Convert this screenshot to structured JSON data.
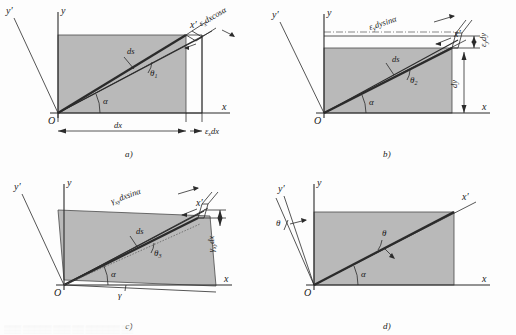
{
  "figure": {
    "background_color": "#fdfdfd",
    "box_fill_color": "#b9b9b9",
    "line_color": "#2b2b2b",
    "bleed_text": "▒▒▒ ▒▒▒▒▒ ▒▒▒ ▒▒ ▒▒▒▒▒▒ ▒▒"
  },
  "axis_labels": {
    "x": "x",
    "y": "y",
    "x_prime": "x′",
    "y_prime": "y′",
    "origin": "O"
  },
  "panels": [
    {
      "id": "a",
      "caption": "a)",
      "elements": {
        "diagonal_label": "ds",
        "rotation_angle": "θ",
        "rotation_angle_sub": "1",
        "base_angle": "α",
        "horizontal_dim": "dx",
        "elongation_dim": "ε",
        "elongation_dim_sub": "x",
        "elongation_dim_tail": "dx",
        "projection_label": "ε",
        "projection_label_sub": "x",
        "projection_label_tail": "dxcosα"
      }
    },
    {
      "id": "b",
      "caption": "b)",
      "elements": {
        "diagonal_label": "ds",
        "rotation_angle": "θ",
        "rotation_angle_sub": "2",
        "base_angle": "α",
        "vertical_dim": "dy",
        "elongation_dim": "ε",
        "elongation_dim_sub": "y",
        "elongation_dim_tail": "dy",
        "projection_label": "ε",
        "projection_label_sub": "y",
        "projection_label_tail": "dysinα"
      }
    },
    {
      "id": "c",
      "caption": "c)",
      "elements": {
        "diagonal_label": "ds",
        "rotation_angle": "θ",
        "rotation_angle_sub": "3",
        "base_angle": "α",
        "shear_angle": "γ",
        "shear_dim": "γ",
        "shear_dim_sub": "xy",
        "shear_dim_tail": "dx",
        "projection_label": "γ",
        "projection_label_sub": "xy",
        "projection_label_tail": "dxsinα"
      }
    },
    {
      "id": "d",
      "caption": "d)",
      "elements": {
        "base_angle": "α",
        "rotation_angle_axis": "θ",
        "rotation_angle_diag": "θ"
      }
    }
  ]
}
